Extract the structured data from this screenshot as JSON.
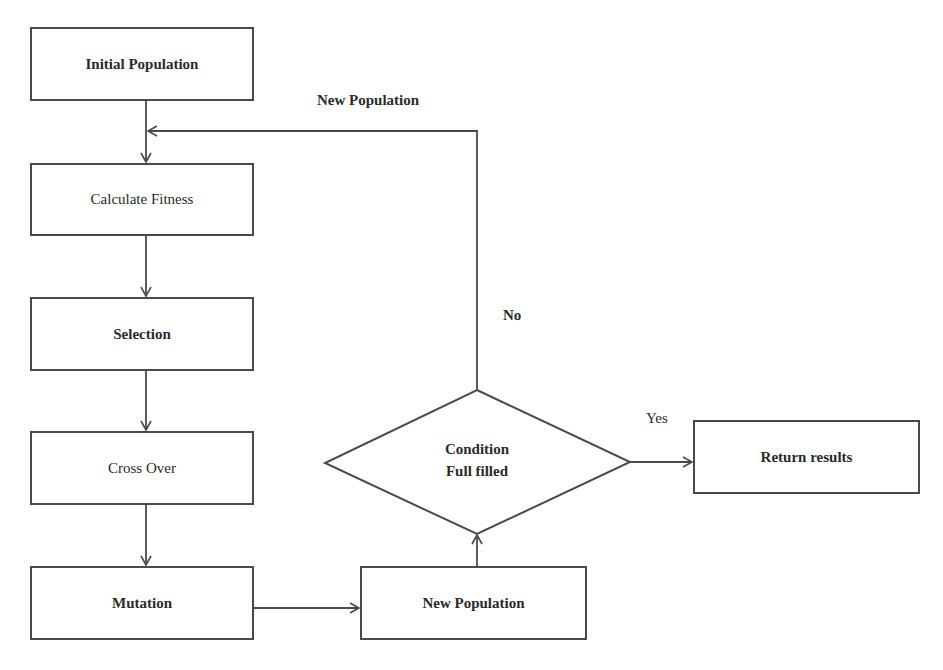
{
  "diagram": {
    "type": "flowchart",
    "nodes": [
      {
        "id": "initial",
        "label": "Initial Population",
        "shape": "rect"
      },
      {
        "id": "fitness",
        "label": "Calculate Fitness",
        "shape": "rect"
      },
      {
        "id": "selection",
        "label": "Selection",
        "shape": "rect"
      },
      {
        "id": "crossover",
        "label": "Cross Over",
        "shape": "rect"
      },
      {
        "id": "mutation",
        "label": "Mutation",
        "shape": "rect"
      },
      {
        "id": "newpop",
        "label": "New Population",
        "shape": "rect"
      },
      {
        "id": "condition",
        "label_line1": "Condition",
        "label_line2": "Full filled",
        "shape": "diamond"
      },
      {
        "id": "results",
        "label": "Return results",
        "shape": "rect"
      }
    ],
    "edges": [
      {
        "from": "initial",
        "to": "fitness"
      },
      {
        "from": "fitness",
        "to": "selection"
      },
      {
        "from": "selection",
        "to": "crossover"
      },
      {
        "from": "crossover",
        "to": "mutation"
      },
      {
        "from": "mutation",
        "to": "newpop"
      },
      {
        "from": "newpop",
        "to": "condition"
      },
      {
        "from": "condition",
        "to": "results",
        "label": "Yes"
      },
      {
        "from": "condition",
        "to": "fitness",
        "label": "No"
      }
    ],
    "edge_labels": {
      "loop": "New Population",
      "no": "No",
      "yes": "Yes"
    },
    "colors": {
      "stroke": "#4a4a4a",
      "text": "#2a2a2a",
      "background": "#ffffff"
    }
  }
}
